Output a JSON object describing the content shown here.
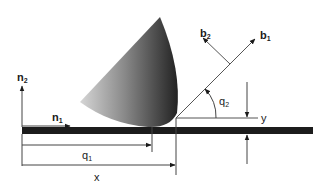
{
  "diagram": {
    "labels": {
      "n1": {
        "base": "n",
        "sub": "1"
      },
      "n2": {
        "base": "n",
        "sub": "2"
      },
      "b1": {
        "base": "b",
        "sub": "1"
      },
      "b2": {
        "base": "b",
        "sub": "2"
      },
      "q1": {
        "base": "q",
        "sub": "1"
      },
      "q2": {
        "base": "q",
        "sub": "2"
      },
      "x": "x",
      "y": "y"
    },
    "colors": {
      "ink": "#1a1a1a",
      "line": "#555555",
      "bar": "#1c1c1c",
      "cone_light": "#c8c8c8",
      "cone_dark": "#2a2a2a"
    }
  }
}
